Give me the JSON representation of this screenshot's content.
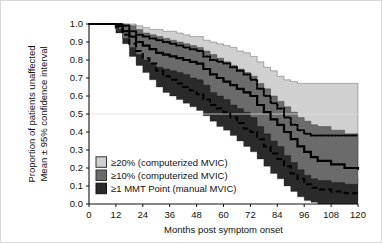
{
  "figure": {
    "border_color": "#d8d8d8",
    "background": "#ffffff"
  },
  "chart_data": {
    "type": "line",
    "title": "",
    "subtitle": "",
    "xlabel": "Months post symptom onset",
    "ylabel": "Proportion of patients unaffected\nMean ± 95% confidence interval",
    "ylabel_line1": "Proportion of patients unaffected",
    "ylabel_line2": "Mean ± 95% confidence interval",
    "xlim": [
      0,
      120
    ],
    "ylim": [
      0.0,
      1.0
    ],
    "xticks": [
      0,
      12,
      24,
      36,
      48,
      60,
      72,
      84,
      96,
      108,
      120
    ],
    "xticklabels": [
      "0",
      "12",
      "24",
      "36",
      "48",
      "60",
      "72",
      "84",
      "96",
      "108",
      "120"
    ],
    "yticks": [
      0.0,
      0.1,
      0.2,
      0.3,
      0.4,
      0.5,
      0.6,
      0.7,
      0.8,
      0.9,
      1.0
    ],
    "yticklabels": [
      "0.0",
      "0.1",
      "0.2",
      "0.3",
      "0.4",
      "0.5",
      "0.6",
      "0.7",
      "0.8",
      "0.9",
      "1.0"
    ],
    "grid": "horizontal gridline at y=0.5 only",
    "gridlines_y": [
      0.5
    ],
    "legend_position": "lower-left inside axes",
    "legend": [
      {
        "label": "≥20% (computerized MVIC)",
        "swatch": "#d0d0d0",
        "swatch_border": "#333333",
        "line_style": "dotted"
      },
      {
        "label": "≥10% (computerized MVIC)",
        "swatch": "#6b6b6b",
        "swatch_border": "#333333",
        "line_style": "solid"
      },
      {
        "label": "≥1 MMT Point (manual MVIC)",
        "swatch": "#2a2a2a",
        "swatch_border": "#111111",
        "line_style": "dashed"
      }
    ],
    "series": [
      {
        "name": "≥20% (computerized MVIC)",
        "line_style": "dotted",
        "band_color": "#d0d0d0",
        "x": [
          0,
          6,
          12,
          15,
          18,
          21,
          24,
          27,
          30,
          33,
          36,
          39,
          42,
          45,
          48,
          51,
          54,
          57,
          60,
          63,
          66,
          69,
          72,
          75,
          78,
          81,
          84,
          87,
          90,
          93,
          96,
          99,
          102,
          108,
          114,
          120
        ],
        "mean": [
          1.0,
          1.0,
          1.0,
          0.99,
          0.96,
          0.94,
          0.93,
          0.92,
          0.91,
          0.9,
          0.89,
          0.88,
          0.87,
          0.86,
          0.85,
          0.82,
          0.8,
          0.79,
          0.78,
          0.76,
          0.74,
          0.72,
          0.69,
          0.64,
          0.6,
          0.56,
          0.53,
          0.48,
          0.44,
          0.41,
          0.39,
          0.38,
          0.38,
          0.38,
          0.38,
          0.38
        ],
        "ci_low": [
          1.0,
          1.0,
          0.99,
          0.96,
          0.9,
          0.87,
          0.85,
          0.84,
          0.83,
          0.82,
          0.81,
          0.8,
          0.79,
          0.78,
          0.77,
          0.74,
          0.71,
          0.7,
          0.68,
          0.66,
          0.64,
          0.62,
          0.58,
          0.53,
          0.49,
          0.45,
          0.41,
          0.36,
          0.31,
          0.27,
          0.23,
          0.21,
          0.2,
          0.2,
          0.2,
          0.2
        ],
        "ci_high": [
          1.0,
          1.0,
          1.0,
          1.0,
          1.0,
          0.99,
          0.98,
          0.97,
          0.97,
          0.96,
          0.96,
          0.95,
          0.94,
          0.93,
          0.93,
          0.91,
          0.9,
          0.89,
          0.88,
          0.87,
          0.85,
          0.84,
          0.82,
          0.79,
          0.76,
          0.74,
          0.71,
          0.69,
          0.68,
          0.67,
          0.67,
          0.67,
          0.67,
          0.67,
          0.67,
          0.67
        ]
      },
      {
        "name": "≥10% (computerized MVIC)",
        "line_style": "solid",
        "band_color": "#6b6b6b",
        "x": [
          0,
          6,
          12,
          15,
          18,
          21,
          24,
          27,
          30,
          33,
          36,
          39,
          42,
          45,
          48,
          51,
          54,
          57,
          60,
          63,
          66,
          69,
          72,
          75,
          78,
          81,
          84,
          87,
          90,
          93,
          96,
          99,
          102,
          108,
          114,
          120
        ],
        "mean": [
          1.0,
          1.0,
          0.99,
          0.96,
          0.93,
          0.9,
          0.88,
          0.86,
          0.84,
          0.83,
          0.82,
          0.81,
          0.8,
          0.79,
          0.78,
          0.75,
          0.72,
          0.7,
          0.68,
          0.66,
          0.64,
          0.62,
          0.6,
          0.55,
          0.51,
          0.47,
          0.44,
          0.4,
          0.36,
          0.32,
          0.29,
          0.26,
          0.24,
          0.22,
          0.2,
          0.19
        ],
        "ci_low": [
          1.0,
          1.0,
          0.97,
          0.92,
          0.87,
          0.83,
          0.8,
          0.78,
          0.76,
          0.75,
          0.74,
          0.73,
          0.72,
          0.7,
          0.69,
          0.66,
          0.62,
          0.6,
          0.58,
          0.55,
          0.53,
          0.51,
          0.48,
          0.43,
          0.39,
          0.35,
          0.32,
          0.27,
          0.23,
          0.19,
          0.16,
          0.14,
          0.13,
          0.12,
          0.11,
          0.11
        ],
        "ci_high": [
          1.0,
          1.0,
          1.0,
          1.0,
          0.99,
          0.97,
          0.95,
          0.94,
          0.93,
          0.92,
          0.91,
          0.9,
          0.89,
          0.88,
          0.87,
          0.85,
          0.83,
          0.81,
          0.79,
          0.77,
          0.75,
          0.73,
          0.71,
          0.67,
          0.64,
          0.6,
          0.57,
          0.54,
          0.51,
          0.48,
          0.46,
          0.44,
          0.43,
          0.41,
          0.39,
          0.38
        ]
      },
      {
        "name": "≥1 MMT Point (manual MVIC)",
        "line_style": "dashed",
        "band_color": "#2a2a2a",
        "x": [
          0,
          6,
          12,
          15,
          18,
          21,
          24,
          27,
          30,
          33,
          36,
          39,
          42,
          45,
          48,
          51,
          54,
          57,
          60,
          63,
          66,
          69,
          72,
          75,
          78,
          81,
          84,
          87,
          90,
          93,
          96,
          99,
          102,
          108,
          114,
          120
        ],
        "mean": [
          1.0,
          1.0,
          0.98,
          0.94,
          0.89,
          0.85,
          0.81,
          0.78,
          0.74,
          0.71,
          0.69,
          0.67,
          0.65,
          0.63,
          0.61,
          0.58,
          0.55,
          0.53,
          0.51,
          0.48,
          0.45,
          0.42,
          0.4,
          0.36,
          0.32,
          0.28,
          0.25,
          0.21,
          0.17,
          0.14,
          0.11,
          0.09,
          0.08,
          0.07,
          0.06,
          0.06
        ],
        "ci_low": [
          1.0,
          1.0,
          0.95,
          0.89,
          0.82,
          0.77,
          0.73,
          0.69,
          0.65,
          0.62,
          0.6,
          0.58,
          0.56,
          0.54,
          0.52,
          0.49,
          0.46,
          0.43,
          0.41,
          0.38,
          0.35,
          0.32,
          0.29,
          0.25,
          0.21,
          0.17,
          0.14,
          0.1,
          0.07,
          0.04,
          0.02,
          0.01,
          0.0,
          0.0,
          0.0,
          0.0
        ],
        "ci_high": [
          1.0,
          1.0,
          1.0,
          0.99,
          0.96,
          0.93,
          0.9,
          0.87,
          0.84,
          0.81,
          0.79,
          0.77,
          0.75,
          0.73,
          0.71,
          0.68,
          0.65,
          0.63,
          0.61,
          0.58,
          0.55,
          0.52,
          0.5,
          0.46,
          0.43,
          0.4,
          0.37,
          0.33,
          0.29,
          0.26,
          0.23,
          0.21,
          0.2,
          0.17,
          0.14,
          0.12
        ]
      }
    ]
  }
}
